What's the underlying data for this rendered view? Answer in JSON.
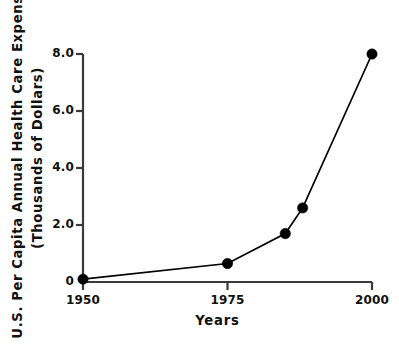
{
  "chart_data": {
    "type": "line",
    "title": "",
    "xlabel": "Years",
    "ylabel": "U.S. Per Capita Annual Health Care Expenses (Thousands of Dollars)",
    "ylabel_line1": "U.S. Per Capita Annual Health Care Expenses",
    "ylabel_line2": "(Thousands of Dollars)",
    "x": [
      1950,
      1975,
      1985,
      1988,
      2000
    ],
    "values": [
      0.1,
      0.65,
      1.7,
      2.6,
      8.0
    ],
    "series": [
      {
        "name": "U.S. Per Capita Annual Health Care Expenses",
        "points": [
          {
            "x": 1950,
            "y": 0.1
          },
          {
            "x": 1975,
            "y": 0.65
          },
          {
            "x": 1985,
            "y": 1.7
          },
          {
            "x": 1988,
            "y": 2.6
          },
          {
            "x": 2000,
            "y": 8.0
          }
        ]
      }
    ],
    "xlim": [
      1950,
      2000
    ],
    "ylim": [
      0,
      8.0
    ],
    "xticks": [
      1950,
      1975,
      2000
    ],
    "xtick_labels": [
      "1950",
      "1975",
      "2000"
    ],
    "yticks": [
      0,
      2.0,
      4.0,
      6.0,
      8.0
    ],
    "ytick_labels": [
      "0",
      "2.0",
      "4.0",
      "6.0",
      "8.0"
    ],
    "grid": false,
    "legend": false,
    "legend_position": "none",
    "marker": "filled-circle",
    "line_color": "#000000",
    "marker_color": "#000000",
    "axis_color": "#3a3a3a",
    "background_color": "#ffffff"
  }
}
